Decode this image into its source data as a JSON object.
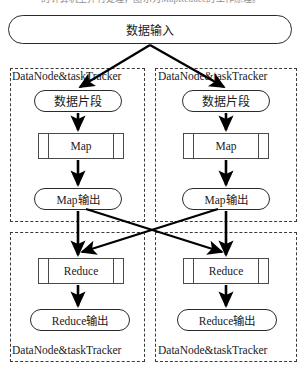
{
  "page": {
    "width": 303,
    "height": 372,
    "background": "#ffffff",
    "cut_off_header_text": "的计算机上并行处理，图示为MapReduce的工作原理。"
  },
  "colors": {
    "stroke": "#2b2b2b",
    "process_stroke": "#4a4a4a",
    "dashed_border": "#3a3a3a",
    "arrow": "#000000",
    "text": "#1a1a1a",
    "background": "#ffffff"
  },
  "diagram": {
    "type": "flowchart",
    "input_node": {
      "label": "数据输入",
      "shape": "rounded-rectangle"
    },
    "groups": [
      {
        "id": "map-node-left",
        "label": "DataNode&taskTracker",
        "label_position": "top",
        "nodes": [
          {
            "id": "split-left",
            "label": "数据片段",
            "shape": "rounded-rectangle"
          },
          {
            "id": "map-left",
            "label": "Map",
            "shape": "process"
          },
          {
            "id": "mapout-left",
            "label": "Map输出",
            "shape": "rounded-rectangle"
          }
        ]
      },
      {
        "id": "map-node-right",
        "label": "DataNode&taskTracker",
        "label_position": "top",
        "nodes": [
          {
            "id": "split-right",
            "label": "数据片段",
            "shape": "rounded-rectangle"
          },
          {
            "id": "map-right",
            "label": "Map",
            "shape": "process"
          },
          {
            "id": "mapout-right",
            "label": "Map输出",
            "shape": "rounded-rectangle"
          }
        ]
      },
      {
        "id": "reduce-node-left",
        "label": "DataNode&taskTracker",
        "label_position": "bottom",
        "nodes": [
          {
            "id": "reduce-left",
            "label": "Reduce",
            "shape": "process"
          },
          {
            "id": "reduceout-left",
            "label": "Reduce输出",
            "shape": "rounded-rectangle"
          }
        ]
      },
      {
        "id": "reduce-node-right",
        "label": "DataNode&taskTracker",
        "label_position": "bottom",
        "nodes": [
          {
            "id": "reduce-right",
            "label": "Reduce",
            "shape": "process"
          },
          {
            "id": "reduceout-right",
            "label": "Reduce输出",
            "shape": "rounded-rectangle"
          }
        ]
      }
    ],
    "edges": [
      {
        "from": "input",
        "to": "split-left",
        "style": "solid-arrow"
      },
      {
        "from": "input",
        "to": "split-right",
        "style": "solid-arrow"
      },
      {
        "from": "split-left",
        "to": "map-left",
        "style": "solid-arrow"
      },
      {
        "from": "map-left",
        "to": "mapout-left",
        "style": "solid-arrow"
      },
      {
        "from": "split-right",
        "to": "map-right",
        "style": "solid-arrow"
      },
      {
        "from": "map-right",
        "to": "mapout-right",
        "style": "solid-arrow"
      },
      {
        "from": "mapout-left",
        "to": "reduce-left",
        "style": "solid-arrow"
      },
      {
        "from": "mapout-left",
        "to": "reduce-right",
        "style": "solid-arrow"
      },
      {
        "from": "mapout-right",
        "to": "reduce-left",
        "style": "solid-arrow"
      },
      {
        "from": "mapout-right",
        "to": "reduce-right",
        "style": "solid-arrow"
      },
      {
        "from": "reduce-left",
        "to": "reduceout-left",
        "style": "solid-arrow"
      },
      {
        "from": "reduce-right",
        "to": "reduceout-right",
        "style": "solid-arrow"
      }
    ]
  }
}
